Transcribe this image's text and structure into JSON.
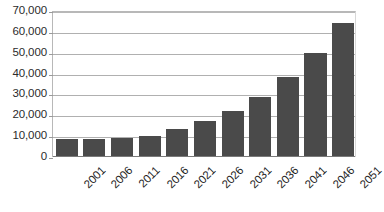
{
  "chart_data": {
    "type": "bar",
    "title": "",
    "subtitle": "",
    "xlabel": "",
    "ylabel": "",
    "categories": [
      "2001",
      "2006",
      "2011",
      "2016",
      "2021",
      "2026",
      "2031",
      "2036",
      "2041",
      "2046",
      "2051"
    ],
    "values": [
      8600,
      8700,
      9000,
      10300,
      13600,
      17200,
      22000,
      29000,
      38200,
      49800,
      64200
    ],
    "series": [
      {
        "name": "",
        "values": [
          8600,
          8700,
          9000,
          10300,
          13600,
          17200,
          22000,
          29000,
          38200,
          49800,
          64200
        ],
        "color": "#4a4a4a"
      }
    ],
    "ylim": [
      0,
      70000
    ],
    "ytick_values": [
      0,
      10000,
      20000,
      30000,
      40000,
      50000,
      60000,
      70000
    ],
    "ytick_labels": [
      "0",
      "10,000",
      "20,000",
      "30,000",
      "40,000",
      "50,000",
      "60,000",
      "70,000"
    ],
    "grid": true,
    "grid_axis": "y",
    "legend": false,
    "legend_position": "none",
    "annotations": [],
    "xtick_rotation": -45,
    "bar_color": "#4a4a4a",
    "gridline_color": "#b0b0b0",
    "plot_border_color": "#b8b8b8",
    "background_color": "#ffffff"
  }
}
